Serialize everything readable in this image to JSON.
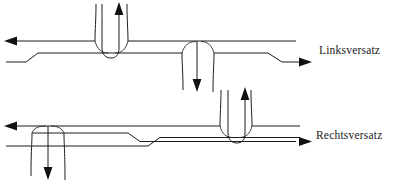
{
  "figure": {
    "kind": "technical-line-diagram",
    "background_color": "#ffffff",
    "line_color": "#1d1d1d"
  },
  "labels": {
    "upper": "Linksversatz",
    "lower": "Rechtsversatz"
  },
  "diagrams": [
    {
      "id": "upper",
      "name": "linksversatz-diagram",
      "label": "Linksversatz",
      "description": "Staggered T-junctions offset to the left",
      "main_road": {
        "upper_edge_y": 41,
        "lower_edge_y": 62,
        "left_arrow_direction": "left",
        "right_arrow_direction": "right"
      },
      "side_roads": [
        {
          "name": "north-leg",
          "x": 110,
          "direction": "up",
          "arrow": "up"
        },
        {
          "name": "south-leg",
          "x": 197,
          "direction": "down",
          "arrow": "down"
        }
      ]
    },
    {
      "id": "lower",
      "name": "rechtsversatz-diagram",
      "label": "Rechtsversatz",
      "description": "Staggered T-junctions offset to the right",
      "main_road": {
        "upper_edge_y": 126,
        "lower_edge_y": 146,
        "left_arrow_direction": "left",
        "right_arrow_direction": "right"
      },
      "side_roads": [
        {
          "name": "south-leg",
          "x": 48,
          "direction": "down",
          "arrow": "down"
        },
        {
          "name": "north-leg",
          "x": 236,
          "direction": "up",
          "arrow": "up"
        }
      ]
    }
  ]
}
